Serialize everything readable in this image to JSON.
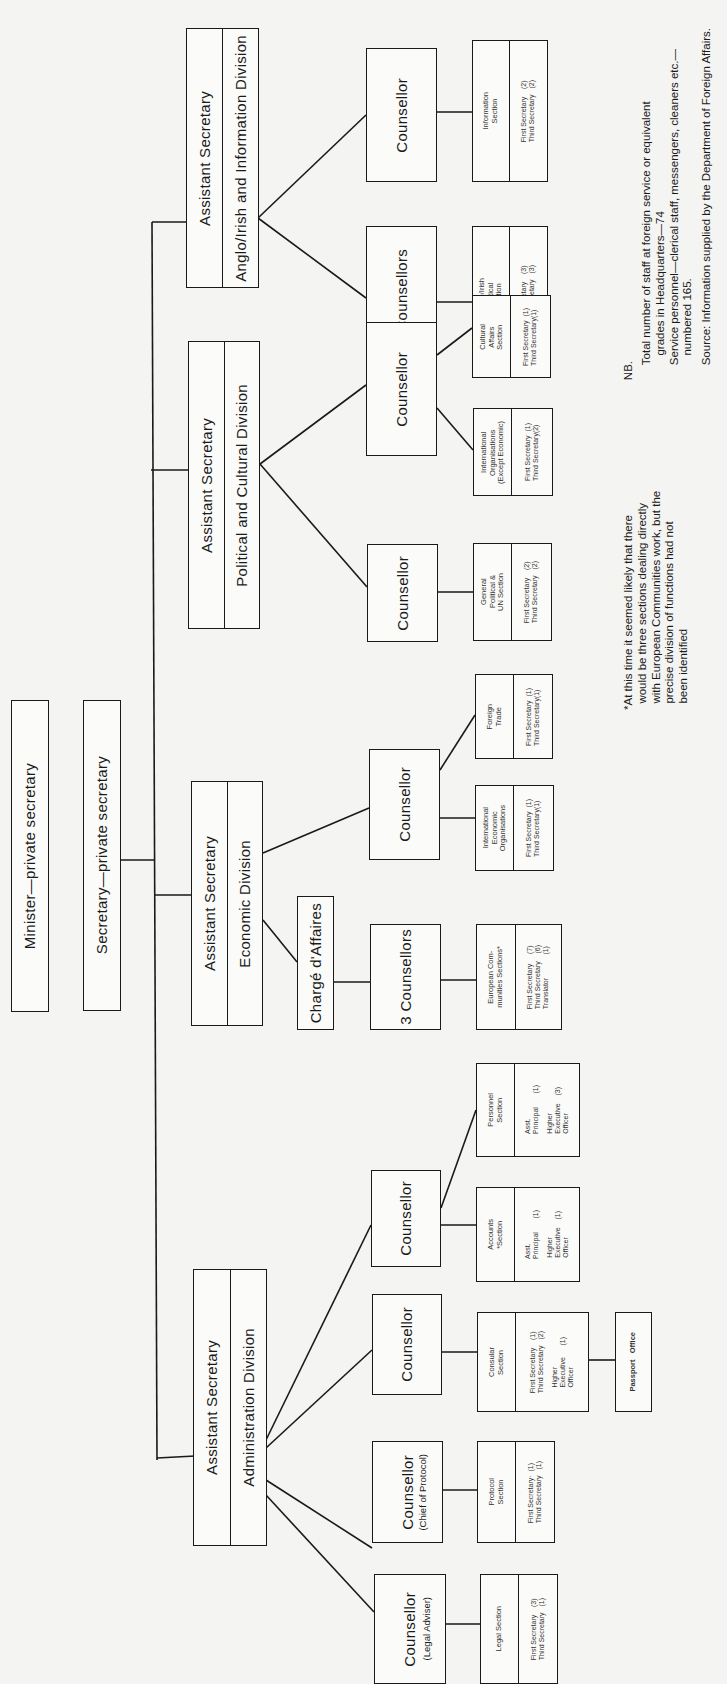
{
  "chart": {
    "minister": "Minister—private secretary",
    "secretary": "Secretary—private secretary",
    "divisions": {
      "anglo_irish": {
        "head": "Assistant Secretary",
        "name": "Anglo/Irish and Information Division"
      },
      "political": {
        "head": "Assistant Secretary",
        "name": "Political and Cultural Division"
      },
      "economic": {
        "head": "Assistant Secretary",
        "name": "Economic Division"
      },
      "admin": {
        "head": "Assistant Secretary",
        "name": "Administration Division"
      }
    },
    "counsellors": {
      "info": "Counsellor",
      "anglo_2": "2 Counsellors",
      "pol_intl": "Counsellor",
      "pol_gen": "Counsellor",
      "econ_intl": "Counsellor",
      "econ_3": "3 Counsellors",
      "charge": "Chargé d'Affaires",
      "acc_pers": "Counsellor",
      "consular": "Counsellor",
      "protocol": "Counsellor",
      "protocol_sub": "(Chief of Protocol)",
      "legal": "Counsellor",
      "legal_sub": "(Legal Adviser)"
    },
    "sections": {
      "info": {
        "name": "Information\nSection",
        "staff": "First Secretary    (2)\nThird Secretary   (2)"
      },
      "anglo": {
        "name": "Anglo/Irish\nPolitical\nSection",
        "staff": "First Secretary    (3)\nThird Secretary   (3)"
      },
      "cultural": {
        "name": "Cultural\nAffairs\nSection",
        "staff": "First Secretary  (1)\nThird Secretary(1)"
      },
      "intl_org": {
        "name": "International\nOrganisations\n(Except Economic)",
        "staff": "First Secretary  (1)\nThird Secretary(2)"
      },
      "gen_pol": {
        "name": "General\nPolitical &\nUN Section",
        "staff": "First Secretary    (2)\nThird Secretary   (2)"
      },
      "foreign_trade": {
        "name": "Foreign\nTrade",
        "staff": "First Secretary  (1)\nThird Secretary(1)"
      },
      "intl_econ": {
        "name": "International\nEconomic\nOrganisations",
        "staff": "First Secretary  (1)\nThird Secretary(1)"
      },
      "euro": {
        "name": "European Com-\nmunities Sections*",
        "staff": "First Secretary     (7)\nThird Secretary    (6)\nTranslator            (1)"
      },
      "personnel": {
        "name": "Personnel\nSection",
        "staff": "Asst.\nPrincipal       (1)",
        "staff2": "Higher\nExecutive    (3)\nOfficer"
      },
      "accounts": {
        "name": "Accounts\n*Section",
        "staff": "Asst.\nPrincipal       (1)",
        "staff2": "Higher\nExecutive    (1)\nOfficer"
      },
      "consular": {
        "name": "Consular\nSection",
        "staff": "First Secretary    (1)\nThird Secretary   (2)",
        "staff2": "Higher\nExecutive      (1)\nOfficer"
      },
      "passport": {
        "name": "Passport   Office"
      },
      "protocol": {
        "name": "Protocol\nSection",
        "staff": "First Secretary·  (1)\nThird Secretary   (1)"
      },
      "legal": {
        "name": "Legal Section",
        "staff": "First Secretary    (3)\nThird Secretary   (1)"
      }
    },
    "notes": {
      "nb_label": "NB.",
      "nb_text": "Total number of staff at foreign service or equivalent\n   grades in Headquarters—74\nService personnel—clerical staff, messengers, cleaners etc.—\n   numbered 165.",
      "source": "Source: Information supplied by the Department of Foreign Affairs.",
      "footnote": "*At this time it seemed likely that there\n  would be three sections dealing directly\n  with European Communities work, but the\n  precise division of functions had not\n  been identified"
    }
  },
  "colors": {
    "line": "#1a1a1a",
    "paper": "#f4f4f2",
    "box": "#fbfbf9"
  }
}
